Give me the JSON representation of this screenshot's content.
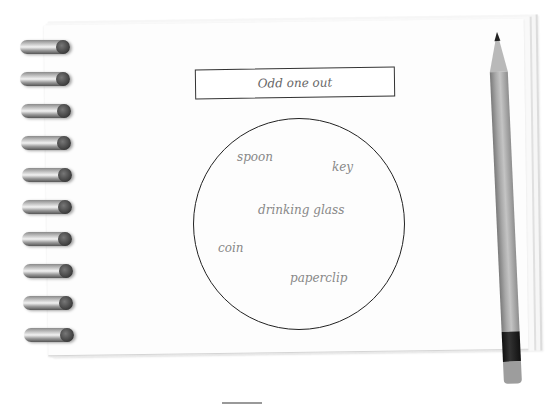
{
  "worksheet": {
    "title": "Odd one out",
    "items": [
      {
        "label": "spoon",
        "x": 237,
        "y": 152
      },
      {
        "label": "key",
        "x": 332,
        "y": 162
      },
      {
        "label": "drinking glass",
        "x": 258,
        "y": 204
      },
      {
        "label": "coin",
        "x": 218,
        "y": 243
      },
      {
        "label": "paperclip",
        "x": 290,
        "y": 272
      }
    ]
  },
  "notebook": {
    "ring_count": 10,
    "ring_y": [
      40,
      72,
      104,
      136,
      168,
      200,
      232,
      264,
      296,
      328
    ]
  },
  "colors": {
    "paper": "#fdfdfd",
    "ink": "#222222",
    "word_text": "#888888"
  }
}
